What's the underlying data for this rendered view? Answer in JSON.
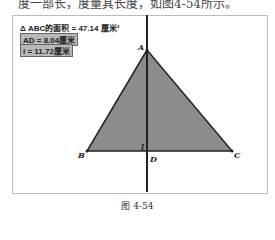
{
  "top_text": "度一部长，度量其长度，如图4-54所示。",
  "measurements": {
    "area": "Δ ABC的面积 = 47.14 厘米²",
    "ad": "AD = 8.04厘米",
    "l": "l = 11.72厘米"
  },
  "points": {
    "A": "A",
    "B": "B",
    "C": "C",
    "D": "D",
    "l": "l"
  },
  "colors": {
    "triangle_fill": "#8c8c8c",
    "stroke": "#222222",
    "box_bg": "#b8b8b8"
  },
  "caption": "图 4-54"
}
